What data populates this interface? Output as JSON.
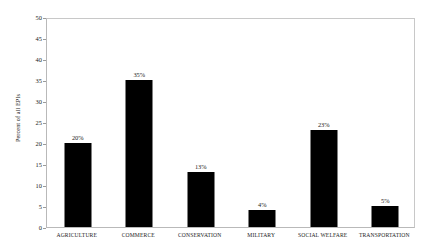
{
  "chart_data": {
    "type": "bar",
    "title": "",
    "xlabel": "",
    "ylabel": "Percent of all EPIs",
    "categories": [
      "AGRICULTURE",
      "COMMERCE",
      "CONSERVATION",
      "MILITARY",
      "SOCIAL WELFARE",
      "TRANSPORTATION"
    ],
    "values": [
      20,
      35,
      13,
      4,
      23,
      5
    ],
    "data_labels": [
      "20%",
      "35%",
      "13%",
      "4%",
      "23%",
      "5%"
    ],
    "ylim": [
      0,
      50
    ],
    "ytick_values": [
      0,
      5,
      10,
      15,
      20,
      25,
      30,
      35,
      40,
      45,
      50
    ],
    "ytick_labels": [
      "0",
      "5",
      "10",
      "15",
      "20",
      "25",
      "30",
      "35",
      "40",
      "45",
      "50"
    ],
    "grid": false,
    "legend": "none",
    "bar_color": "#000000",
    "plot_border_color": "#b9b9b9",
    "background_color": "#ffffff"
  }
}
